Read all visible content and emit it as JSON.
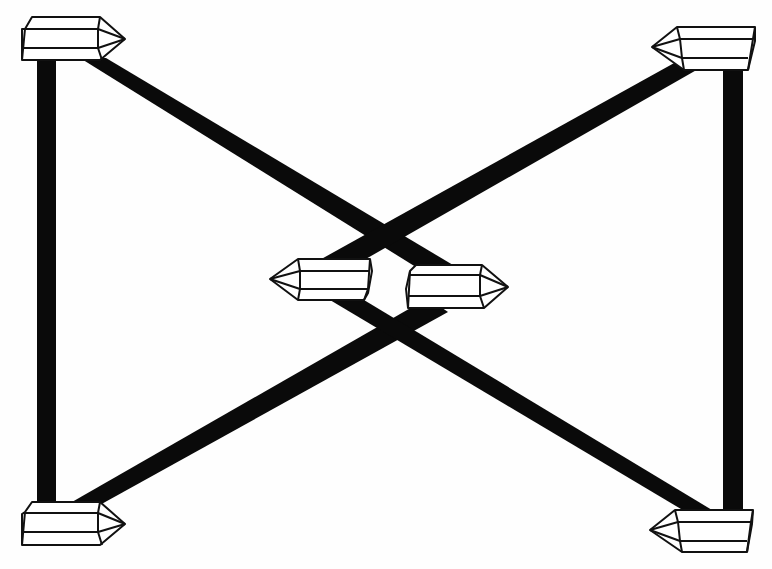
{
  "diagram": {
    "title": "",
    "colors": {
      "bar": "#0a0a0a",
      "crystal_fill": "#ffffff",
      "crystal_outline": "#111111",
      "background": "#fefefe"
    },
    "nodes": [
      {
        "id": "crystal-top-left",
        "points": "right",
        "x": 22,
        "y": 17
      },
      {
        "id": "crystal-top-right",
        "points": "left",
        "x": 652,
        "y": 27
      },
      {
        "id": "crystal-center-left",
        "points": "left",
        "x": 270,
        "y": 259
      },
      {
        "id": "crystal-center-right",
        "points": "right",
        "x": 406,
        "y": 265
      },
      {
        "id": "crystal-bottom-left",
        "points": "right",
        "x": 22,
        "y": 502
      },
      {
        "id": "crystal-bottom-right",
        "points": "left",
        "x": 650,
        "y": 510
      }
    ],
    "edges": [
      {
        "from": "crystal-top-left",
        "to": "crystal-bottom-left",
        "style": "thick-vertical"
      },
      {
        "from": "crystal-top-right",
        "to": "crystal-bottom-right",
        "style": "thick-vertical"
      },
      {
        "from": "crystal-top-left",
        "to": "crystal-center-right",
        "style": "thick-diagonal"
      },
      {
        "from": "crystal-top-right",
        "to": "crystal-center-left",
        "style": "thick-diagonal"
      },
      {
        "from": "crystal-bottom-left",
        "to": "crystal-center-right",
        "style": "thick-diagonal"
      },
      {
        "from": "crystal-bottom-right",
        "to": "crystal-center-left",
        "style": "thick-diagonal"
      }
    ]
  }
}
